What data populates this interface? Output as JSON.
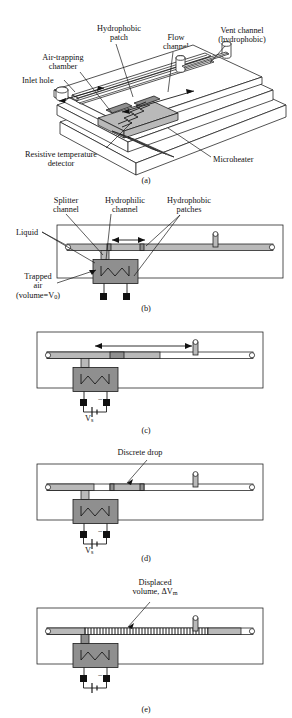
{
  "figure": {
    "colors": {
      "line": "#1a1a1a",
      "liquid_gray": "#b9b9b9",
      "chamber_gray": "#8f8f8f",
      "background": "#ffffff"
    }
  },
  "panel_a": {
    "caption": "(a)",
    "labels": {
      "hydrophobic_patch": "Hydrophobic\npatch",
      "hydrophobic_patch_l1": "Hydrophobic",
      "hydrophobic_patch_l2": "patch",
      "flow_channel_l1": "Flow",
      "flow_channel_l2": "channel",
      "vent_channel_l1": "Vent channel",
      "vent_channel_l2": "(hydrophobic)",
      "air_trapping_l1": "Air-trapping",
      "air_trapping_l2": "chamber",
      "inlet_hole": "Inlet hole",
      "rtd_l1": "Resistive temperature",
      "rtd_l2": "detector",
      "microheater": "Microheater"
    },
    "dimensions": {
      "ld": "L",
      "ld_sub": "d",
      "l": "L"
    }
  },
  "panel_b": {
    "caption": "(b)",
    "labels": {
      "splitter_l1": "Splitter",
      "splitter_l2": "channel",
      "hydrophilic_l1": "Hydrophilic",
      "hydrophilic_l2": "channel",
      "hydrophobic_patches_l1": "Hydrophobic",
      "hydrophobic_patches_l2": "patches",
      "liquid": "Liquid",
      "trapped_air_l1": "Trapped",
      "trapped_air_l2": "air",
      "trapped_air_l3": "(volume=V",
      "trapped_air_sub": "0",
      "trapped_air_l3_end": ")"
    },
    "dimensions": {
      "ld": "L",
      "ld_sub": "d"
    }
  },
  "panel_c": {
    "caption": "(c)",
    "dimensions": {
      "l": "L"
    },
    "supply": {
      "plus": "+",
      "minus": "−",
      "voltage": "V",
      "voltage_sub": "s"
    }
  },
  "panel_d": {
    "caption": "(d)",
    "labels": {
      "discrete_drop": "Discrete drop"
    },
    "supply": {
      "plus": "+",
      "minus": "−",
      "voltage": "V",
      "voltage_sub": "s"
    }
  },
  "panel_e": {
    "caption": "(e)",
    "labels": {
      "displaced_l1": "Displaced",
      "displaced_l2": "volume, ΔV",
      "displaced_sub": "m"
    },
    "supply": {
      "plus": "+",
      "minus": "−"
    }
  }
}
